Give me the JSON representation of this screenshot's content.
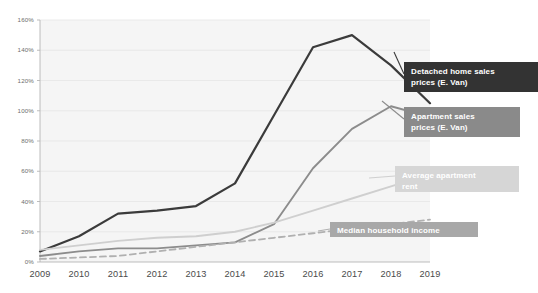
{
  "chart_data": {
    "type": "line",
    "title": "",
    "subtitle": "",
    "xlabel": "",
    "ylabel": "",
    "x": [
      "2009",
      "2010",
      "2011",
      "2012",
      "2013",
      "2014",
      "2015",
      "2016",
      "2017",
      "2018",
      "2019"
    ],
    "ylim": [
      0,
      160
    ],
    "ytick_labels": [
      "0%",
      "20%",
      "40%",
      "60%",
      "80%",
      "100%",
      "120%",
      "140%",
      "160%"
    ],
    "ytick_values": [
      0,
      20,
      40,
      60,
      80,
      100,
      120,
      140,
      160
    ],
    "grid": true,
    "legend_position": "inline-right-annotations",
    "series": [
      {
        "name": "Detached home sales prices  (E. Van)",
        "label_line1": "Detached home sales",
        "label_line2": "prices  (E. Van)",
        "color": "#3b3b3b",
        "box_color": "#333333",
        "style": "solid",
        "values": [
          7,
          17,
          32,
          34,
          37,
          52,
          97,
          142,
          150,
          130,
          105
        ]
      },
      {
        "name": "Apartment sales prices (E. Van)",
        "label_line1": "Apartment sales",
        "label_line2": "prices (E. Van)",
        "color": "#8c8c8c",
        "box_color": "#8a8a8a",
        "style": "solid",
        "values": [
          4,
          7,
          9,
          9,
          11,
          13,
          25,
          62,
          88,
          103,
          96
        ]
      },
      {
        "name": "Average  apartment rent",
        "label_line1": "Average  apartment",
        "label_line2": "rent",
        "color": "#cfcfcf",
        "box_color": "#d6d6d6",
        "style": "solid",
        "values": [
          8,
          11,
          14,
          16,
          17,
          20,
          26,
          34,
          42,
          50,
          58
        ]
      },
      {
        "name": "Median household income",
        "label_line1": "Median household income",
        "label_line2": "",
        "color": "#b0b0b0",
        "box_color": "#a8a8a8",
        "style": "dashed",
        "values": [
          2,
          3,
          4,
          7,
          10,
          13,
          16,
          19,
          22,
          25,
          28
        ]
      }
    ]
  },
  "colors": {
    "plot_background": "#f5f5f5",
    "page_background": "#ffffff",
    "axis": "#b5b5b5",
    "gridline": "#e4e4e4",
    "ytick_text": "#6d6d6d",
    "xtick_text": "#4a4a4a"
  }
}
